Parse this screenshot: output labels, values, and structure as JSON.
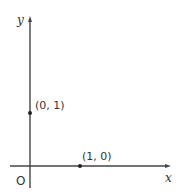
{
  "diagram": {
    "type": "coordinate-axes",
    "axes": {
      "x_label": "x",
      "y_label": "y",
      "origin_label": "O"
    },
    "points": [
      {
        "label": "(0, 1)",
        "x": 0,
        "y": 1
      },
      {
        "label": "(1, 0)",
        "x": 1,
        "y": 0
      }
    ],
    "colors": {
      "axis": "#444444",
      "point": "#222222",
      "text": "#333333",
      "background": "#ffffff"
    }
  }
}
